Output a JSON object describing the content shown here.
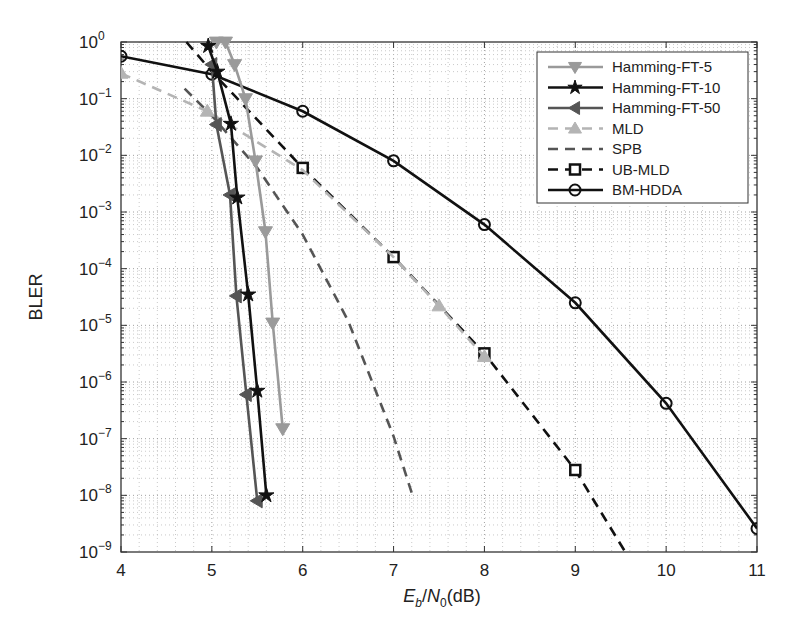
{
  "chart_data": {
    "type": "line",
    "title": "",
    "xlabel": "E_b/N_0(dB)",
    "xlabel_parts": {
      "E": "E",
      "b": "b",
      "slash": "/",
      "N": "N",
      "zero": "0",
      "unit": "(dB)"
    },
    "ylabel": "BLER",
    "xlim": [
      4,
      11
    ],
    "ylim": [
      1e-09,
      1
    ],
    "yscale": "log",
    "grid": true,
    "legend_position": "upper right",
    "x_ticks": [
      "4",
      "5",
      "6",
      "7",
      "8",
      "9",
      "10",
      "11"
    ],
    "y_ticks": [
      {
        "base": "10",
        "exp": "0"
      },
      {
        "base": "10",
        "exp": "−1"
      },
      {
        "base": "10",
        "exp": "−2"
      },
      {
        "base": "10",
        "exp": "−3"
      },
      {
        "base": "10",
        "exp": "−4"
      },
      {
        "base": "10",
        "exp": "−5"
      },
      {
        "base": "10",
        "exp": "−6"
      },
      {
        "base": "10",
        "exp": "−7"
      },
      {
        "base": "10",
        "exp": "−8"
      },
      {
        "base": "10",
        "exp": "−9"
      }
    ],
    "series": [
      {
        "name": "Hamming-FT-5",
        "color": "#9a9a9a",
        "dash": "solid",
        "marker": "triangle-down",
        "x": [
          5.05,
          5.15,
          5.25,
          5.37,
          5.48,
          5.59,
          5.67,
          5.78
        ],
        "y": [
          1.0,
          1.0,
          0.4,
          0.1,
          0.008,
          0.00045,
          1.1e-05,
          1.5e-07
        ]
      },
      {
        "name": "Hamming-FT-10",
        "color": "#111111",
        "dash": "solid",
        "marker": "star",
        "x": [
          4.96,
          5.06,
          5.21,
          5.28,
          5.4,
          5.5,
          5.6
        ],
        "y": [
          0.85,
          0.3,
          0.036,
          0.0018,
          3.5e-05,
          7e-07,
          1e-08
        ]
      },
      {
        "name": "Hamming-FT-50",
        "color": "#555555",
        "dash": "solid",
        "marker": "triangle-left",
        "x": [
          5.0,
          5.05,
          5.2,
          5.27,
          5.38,
          5.5
        ],
        "y": [
          0.4,
          0.035,
          0.002,
          3.3e-05,
          6e-07,
          8e-09
        ]
      },
      {
        "name": "MLD",
        "color": "#b4b4b4",
        "dash": "dashed",
        "marker": "triangle-up",
        "x": [
          4,
          4.95,
          6,
          7,
          7.5,
          8
        ],
        "y": [
          0.28,
          0.06,
          0.0055,
          0.00016,
          2.2e-05,
          2.8e-06
        ]
      },
      {
        "name": "SPB",
        "color": "#555555",
        "dash": "dashed",
        "marker": "none",
        "x": [
          4.7,
          5.0,
          5.5,
          6.0,
          6.5,
          7.0,
          7.2
        ],
        "y": [
          0.15,
          0.05,
          0.006,
          0.0004,
          1.2e-05,
          1.1e-07,
          1.1e-08
        ]
      },
      {
        "name": "UB-MLD",
        "color": "#111111",
        "dash": "dashed",
        "marker": "square",
        "x": [
          4.72,
          5.0,
          6,
          7,
          8,
          9,
          9.55
        ],
        "y": [
          1.0,
          0.3,
          0.006,
          0.00016,
          3.2e-06,
          2.8e-08,
          1e-09
        ]
      },
      {
        "name": "BM-HDDA",
        "color": "#111111",
        "dash": "solid",
        "marker": "circle",
        "x": [
          4,
          5,
          6,
          7,
          8,
          9,
          10,
          11
        ],
        "y": [
          0.56,
          0.27,
          0.06,
          0.008,
          0.0006,
          2.5e-05,
          4.2e-07,
          2.6e-09
        ]
      }
    ]
  }
}
